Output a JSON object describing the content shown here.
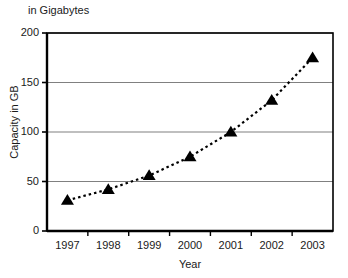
{
  "chart_data": {
    "type": "line",
    "title": "in Gigabytes",
    "xlabel": "Year",
    "ylabel": "Capacity in GB",
    "categories": [
      "1997",
      "1998",
      "1999",
      "2000",
      "2001",
      "2002",
      "2003"
    ],
    "x": [
      1997,
      1998,
      1999,
      2000,
      2001,
      2002,
      2003
    ],
    "values": [
      31,
      42,
      56,
      75,
      100,
      132,
      175
    ],
    "series": [
      {
        "name": "Capacity in GB",
        "values": [
          31,
          42,
          56,
          75,
          100,
          132,
          175
        ]
      }
    ],
    "ylim": [
      0,
      200
    ],
    "y_ticks": [
      0,
      50,
      100,
      150,
      200
    ],
    "y_tick_labels": [
      "0",
      "50",
      "100",
      "150",
      "200"
    ],
    "x_tick_labels": [
      "1997",
      "1998",
      "1999",
      "2000",
      "2001",
      "2002",
      "2003"
    ],
    "grid": "horizontal",
    "legend": "none",
    "marker": "triangle-up",
    "marker_color": "#000000",
    "line_style": "dotted",
    "line_color": "#000000",
    "gridline_color": "#808080",
    "axis_color": "#000000",
    "background_color": "#ffffff"
  }
}
